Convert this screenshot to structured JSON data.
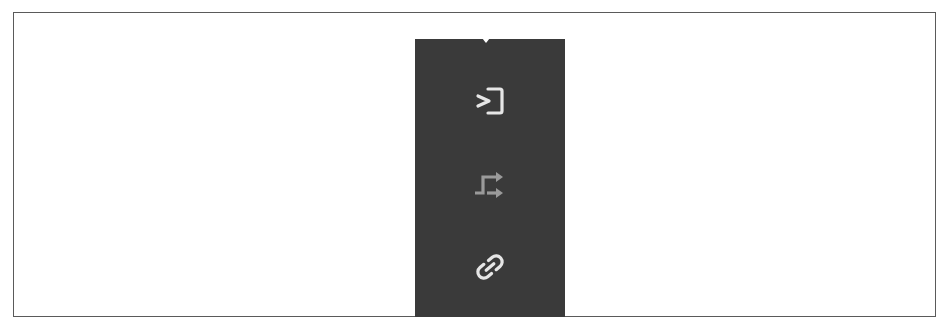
{
  "toolbar": {
    "background": "#3a3a3a",
    "buttons": [
      {
        "icon": "enter-frame-icon",
        "color": "#e6e6e6",
        "state": "enabled"
      },
      {
        "icon": "route-arrows-icon",
        "color": "#9a9a9a",
        "state": "disabled"
      },
      {
        "icon": "link-icon",
        "color": "#e6e6e6",
        "state": "enabled"
      }
    ]
  }
}
